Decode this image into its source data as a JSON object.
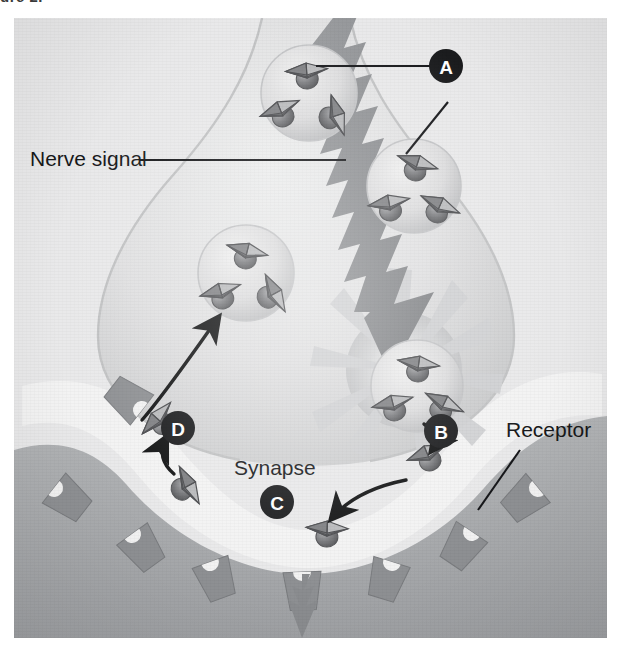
{
  "figure": {
    "caption_sliver": "ure 2.",
    "medium": "airbrush illustration, grayscale halftone scan"
  },
  "labels": [
    {
      "id": "nerve-signal",
      "text": "Nerve signal",
      "x": 28,
      "y": 148,
      "anchor": "start",
      "leader": "horizontal line running right to the lightning-bolt action potential"
    },
    {
      "id": "synapse",
      "text": "Synapse",
      "x": 232,
      "y": 457,
      "anchor": "start",
      "leader": "none"
    },
    {
      "id": "receptor",
      "text": "Receptor",
      "x": 504,
      "y": 419,
      "anchor": "start",
      "leader": "diagonal line running down-left to a receptor on the postsynaptic membrane"
    }
  ],
  "markers": [
    {
      "letter": "A",
      "x": 446,
      "y": 66,
      "meaning": "synaptic vesicles containing neurotransmitter"
    },
    {
      "letter": "B",
      "x": 441,
      "y": 431,
      "meaning": "neurotransmitter released into the synaptic cleft"
    },
    {
      "letter": "C",
      "x": 277,
      "y": 502,
      "meaning": "neurotransmitter bound to postsynaptic receptor"
    },
    {
      "letter": "D",
      "x": 178,
      "y": 428,
      "meaning": "reuptake of neurotransmitter into the presynaptic terminal"
    }
  ],
  "structures": {
    "presynaptic_terminal": "large bulb-shaped axon terminal filling the upper half of the panel",
    "postsynaptic_cell": "darker grey arc-shaped cell across the lower portion of the panel",
    "synaptic_cleft": "pale gap between the terminal and the postsynaptic membrane",
    "action_potential": "jagged lightning-bolt arrow descending from top to the release site",
    "fusion_burst": "starburst where a vesicle fuses with the presynaptic membrane",
    "output_arrow": "jagged arrow leaving the postsynaptic cell at the bottom"
  },
  "vesicles": [
    {
      "id": "vesicle-1",
      "cx": 295,
      "cy": 75,
      "r": 48,
      "molecules": 3,
      "state": "docked near membrane, upper"
    },
    {
      "id": "vesicle-2",
      "cx": 400,
      "cy": 168,
      "r": 47,
      "molecules": 3,
      "state": "travelling toward membrane"
    },
    {
      "id": "vesicle-3",
      "cx": 232,
      "cy": 255,
      "r": 48,
      "molecules": 3,
      "state": "recycled vesicle, refilled"
    },
    {
      "id": "vesicle-4",
      "cx": 403,
      "cy": 368,
      "r": 46,
      "molecules": 3,
      "state": "fusing with presynaptic membrane"
    }
  ],
  "free_molecules": [
    {
      "id": "molecule-release",
      "x": 415,
      "y": 440,
      "note": "just released, marker B"
    },
    {
      "id": "molecule-bound",
      "x": 313,
      "y": 515,
      "note": "bound in receptor pocket, marker C"
    },
    {
      "id": "molecule-reuptake",
      "x": 170,
      "y": 470,
      "note": "returning toward transporter, marker D"
    },
    {
      "id": "molecule-transporter",
      "x": 147,
      "y": 404,
      "note": "entering reuptake transporter"
    }
  ],
  "arrows": [
    {
      "id": "arrow-release-to-receptor",
      "from": "B",
      "to": "C",
      "style": "curved black arrow"
    },
    {
      "id": "arrow-reuptake-up",
      "from": "cleft",
      "to": "transporter",
      "style": "curved black arrow"
    },
    {
      "id": "arrow-recycle-to-vesicle",
      "from": "transporter",
      "to": "vesicle-3",
      "style": "curved black arrow"
    },
    {
      "id": "arrow-vesicle-to-cleft",
      "from": "vesicle-4",
      "to": "B",
      "style": "curved black arrow"
    }
  ],
  "receptors": {
    "count": 7,
    "shape": "notched trapezoidal blocks set into the postsynaptic membrane",
    "color": "#8e9093"
  },
  "colors": {
    "paper": "#ececed",
    "panel_background": "#e7e7e8",
    "terminal_fill": "#dedede",
    "terminal_edge": "#b9b9ba",
    "cleft": "#f2f2f2",
    "postsynaptic_cell": "#a9abad",
    "receptor_block": "#8e9093",
    "bolt": "#8c8e91",
    "molecule_dark": "#6e6f72",
    "molecule_light": "#c6c7c9",
    "label_text": "#17181a",
    "marker_fill": "#1b1c1e",
    "marker_text": "#ffffff"
  }
}
